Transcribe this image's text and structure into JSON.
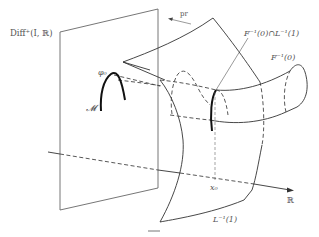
{
  "figure": {
    "labels": {
      "diff_space": "Diff",
      "diff_space_sub": "+",
      "diff_space_args": "(I, ℝ)",
      "projection": "pr",
      "intersection": "F⁻¹(0)∩L⁻¹(1)",
      "F_zero": "F⁻¹(0)",
      "phi0": "φ₀",
      "manifold": "𝓜",
      "x0": "x₀",
      "reals": "ℝ",
      "L_one": "L⁻¹(1)"
    },
    "caption": "—"
  }
}
